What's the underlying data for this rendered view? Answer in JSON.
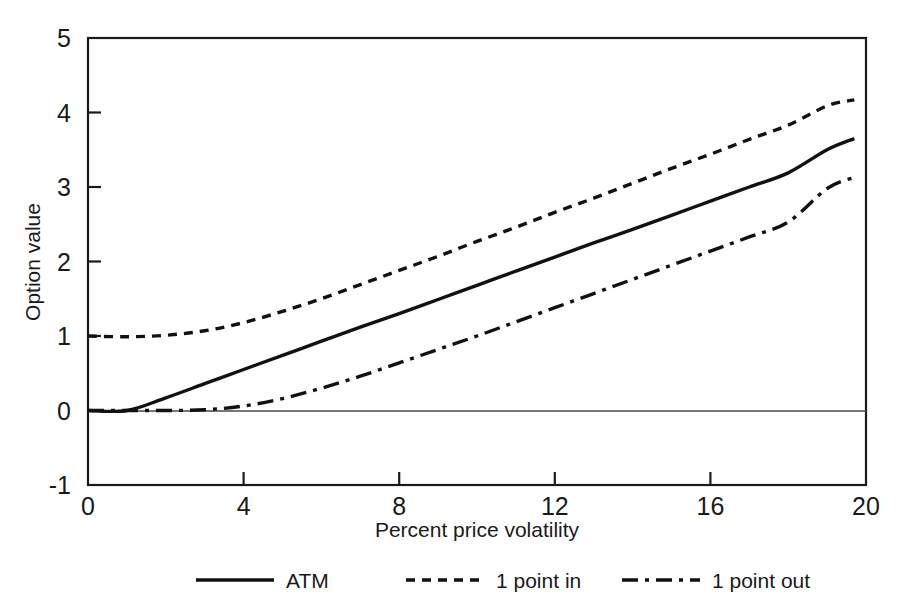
{
  "chart_data": {
    "type": "line",
    "title": "",
    "xlabel": "Percent price volatility",
    "ylabel": "Option value",
    "xlim": [
      0,
      20
    ],
    "ylim": [
      -1,
      5
    ],
    "xticks": [
      0,
      4,
      8,
      12,
      16,
      20
    ],
    "yticks": [
      -1,
      0,
      1,
      2,
      3,
      4,
      5
    ],
    "xtick_labels": [
      "0",
      "4",
      "8",
      "12",
      "16",
      "20"
    ],
    "ytick_labels": [
      "-1",
      "0",
      "1",
      "2",
      "3",
      "4",
      "5"
    ],
    "grid": false,
    "legend_position": "below",
    "x": [
      0,
      1,
      2,
      3,
      4,
      5,
      6,
      7,
      8,
      9,
      10,
      11,
      12,
      13,
      14,
      15,
      16,
      17,
      18,
      19,
      19.7
    ],
    "series": [
      {
        "name": "ATM",
        "style": "solid",
        "color": "#111111",
        "values": [
          0.0,
          0.0,
          0.17,
          0.36,
          0.55,
          0.74,
          0.93,
          1.12,
          1.3,
          1.49,
          1.68,
          1.87,
          2.06,
          2.25,
          2.43,
          2.62,
          2.81,
          3.0,
          3.19,
          3.5,
          3.65
        ]
      },
      {
        "name": "1 point in",
        "style": "dotted",
        "color": "#111111",
        "values": [
          1.0,
          0.99,
          1.01,
          1.07,
          1.18,
          1.33,
          1.5,
          1.69,
          1.88,
          2.07,
          2.27,
          2.46,
          2.66,
          2.85,
          3.05,
          3.25,
          3.44,
          3.64,
          3.83,
          4.09,
          4.17
        ]
      },
      {
        "name": "1 point out",
        "style": "dashdot",
        "color": "#111111",
        "values": [
          0.0,
          0.0,
          0.0,
          0.01,
          0.06,
          0.16,
          0.3,
          0.46,
          0.64,
          0.82,
          1.0,
          1.19,
          1.38,
          1.57,
          1.76,
          1.95,
          2.14,
          2.33,
          2.53,
          2.98,
          3.13
        ]
      }
    ],
    "legend": [
      {
        "label": "ATM",
        "style": "solid"
      },
      {
        "label": "1 point in",
        "style": "dotted"
      },
      {
        "label": "1 point out",
        "style": "dashdot"
      }
    ]
  },
  "colors": {
    "background": "#ffffff",
    "axis": "#1a1a1a",
    "line": "#111111",
    "zero_line": "#4a4a4a"
  }
}
